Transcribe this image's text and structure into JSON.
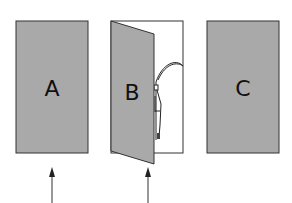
{
  "diagram": {
    "doors": [
      {
        "id": "A",
        "label": "A",
        "state": "closed",
        "arrow_below": true
      },
      {
        "id": "B",
        "label": "B",
        "state": "open",
        "behind": "grim-reaper-with-scythe",
        "arrow_below": true
      },
      {
        "id": "C",
        "label": "C",
        "state": "closed",
        "arrow_below": false
      }
    ],
    "colors": {
      "door_fill": "#a9a9a9",
      "door_stroke": "#333333",
      "frame_fill": "#ffffff",
      "arrow": "#333333"
    }
  }
}
